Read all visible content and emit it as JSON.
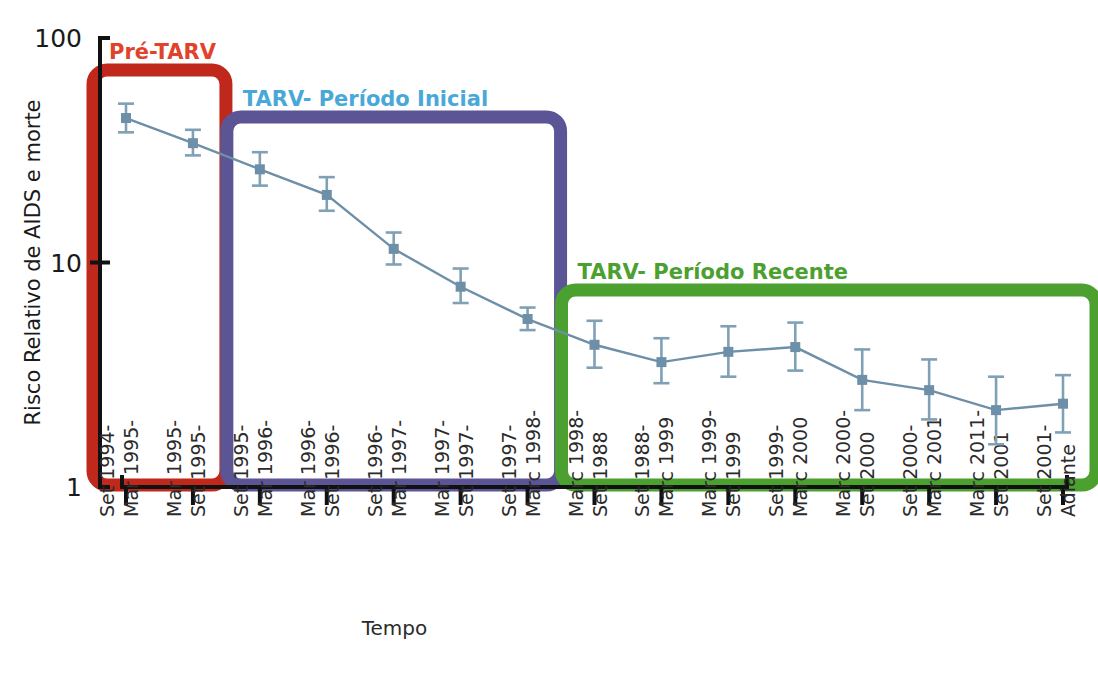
{
  "figure": {
    "background": "#ffffff",
    "axis_color": "#111111",
    "series_color": "#6d8fa8",
    "errorbar_color": "#7fa0b5"
  },
  "chart_data": {
    "type": "line",
    "title": "",
    "xlabel": "Tempo",
    "ylabel": "Risco Relativo de AIDS e morte",
    "yscale": "log",
    "ylim": [
      1,
      100
    ],
    "ytick_labels": [
      "100",
      "10",
      "1"
    ],
    "ytick_values": [
      100,
      10,
      1
    ],
    "grid": false,
    "legend_position": "none",
    "categories": [
      "Set 1994-\nMar 1995-",
      "Mar 1995-\nSet 1995-",
      "Set 1995-\nMar 1996-",
      "Mar 1996-\nSet 1996-",
      "Set 1996-\nMar 1997-",
      "Mar 1997-\nSet 1997-",
      "Set 1997-\nMarc 1998-",
      "Marc 1998-\nSet 1988",
      "Set 1988-\nMarc 1999",
      "Marc 1999-\nSet 1999",
      "Set 1999-\nMarc 2000",
      "Marc 2000-\nSet 2000",
      "Set 2000-\nMarc 2001",
      "Marc 2011-\nSet 2001",
      "Set 2001-\nAdiante"
    ],
    "xtick_lines": [
      [
        "Set 1994-",
        "Mar 1995-"
      ],
      [
        "Mar 1995-",
        "Set 1995-"
      ],
      [
        "Set 1995-",
        "Mar 1996-"
      ],
      [
        "Mar 1996-",
        "Set 1996-"
      ],
      [
        "Set 1996-",
        "Mar 1997-"
      ],
      [
        "Mar 1997-",
        "Set 1997-"
      ],
      [
        "Set 1997-",
        "Marc 1998-"
      ],
      [
        "Marc 1998-",
        "Set 1988"
      ],
      [
        "Set 1988-",
        "Marc 1999"
      ],
      [
        "Marc 1999-",
        "Set 1999"
      ],
      [
        "Set 1999-",
        "Marc 2000"
      ],
      [
        "Marc 2000-",
        "Set 2000"
      ],
      [
        "Set 2000-",
        "Marc 2001"
      ],
      [
        "Marc 2011-",
        "Set 2001"
      ],
      [
        "Set 2001-",
        "Adiante"
      ]
    ],
    "series": [
      {
        "name": "Risco Relativo de AIDS e morte",
        "values": [
          44,
          34,
          26,
          20,
          11.5,
          7.8,
          5.6,
          4.3,
          3.6,
          4.0,
          4.2,
          3.0,
          2.7,
          2.2,
          2.35
        ],
        "ci_low": [
          38,
          30,
          22,
          17,
          9.8,
          6.6,
          5.0,
          3.4,
          2.9,
          3.1,
          3.3,
          2.2,
          2.0,
          1.55,
          1.75
        ],
        "ci_high": [
          51,
          39,
          31,
          24,
          13.6,
          9.4,
          6.3,
          5.5,
          4.6,
          5.2,
          5.4,
          4.1,
          3.7,
          3.1,
          3.15
        ]
      }
    ],
    "annotations": [
      {
        "id": "pre-tarv",
        "label": "Pré-TARV",
        "color": "#c0281c",
        "text_color": "#e0422a",
        "span_start": 0,
        "span_end": 1
      },
      {
        "id": "tarv-inicial",
        "label": "TARV- Período Inicial",
        "color": "#5b5596",
        "text_color": "#4aa8d8",
        "span_start": 2,
        "span_end": 6
      },
      {
        "id": "tarv-recente",
        "label": "TARV- Período Recente",
        "color": "#4ba02f",
        "text_color": "#4ba02f",
        "span_start": 7,
        "span_end": 14
      }
    ]
  }
}
